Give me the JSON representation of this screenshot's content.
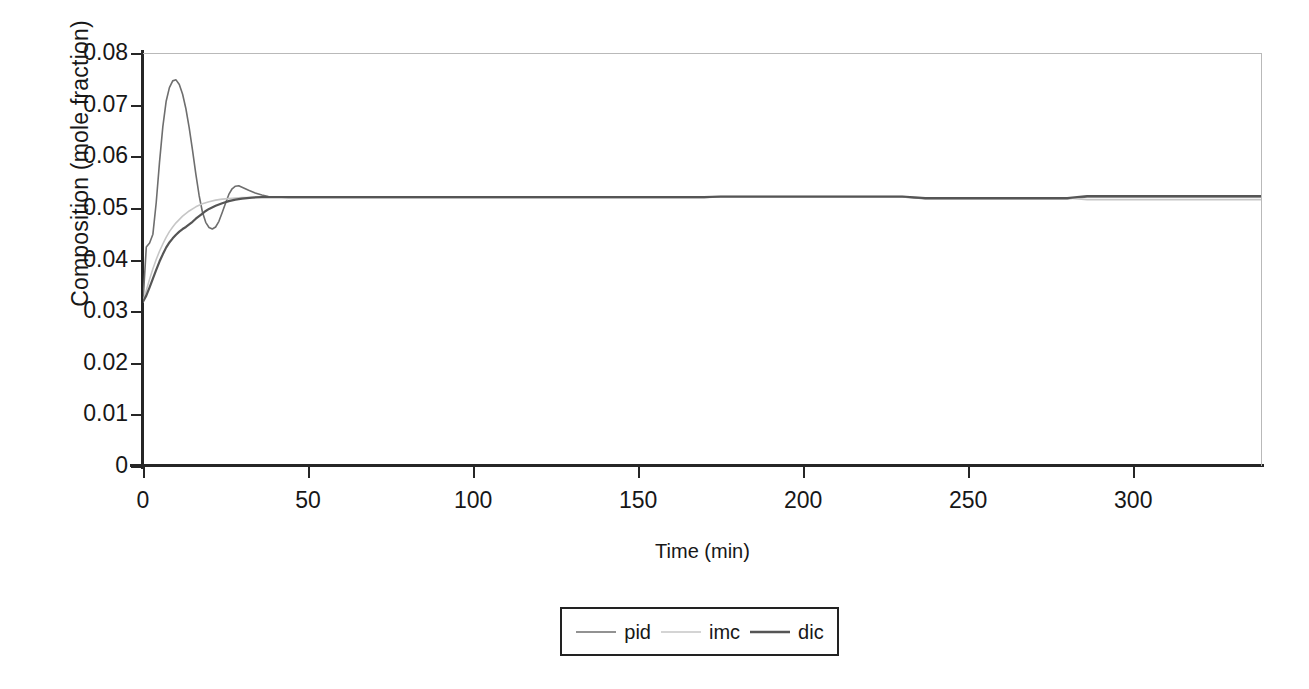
{
  "chart_data": {
    "type": "line",
    "title": "",
    "xlabel": "Time (min)",
    "ylabel": "Composition (mole fraction)",
    "xlim": [
      0,
      339
    ],
    "ylim": [
      0,
      0.08
    ],
    "xticks": [
      0,
      50,
      100,
      150,
      200,
      250,
      300
    ],
    "yticks": [
      0,
      0.01,
      0.02,
      0.03,
      0.04,
      0.05,
      0.06,
      0.07,
      0.08
    ],
    "xtick_labels": [
      "0",
      "50",
      "100",
      "150",
      "200",
      "250",
      "300"
    ],
    "ytick_labels": [
      "0",
      "0.01",
      "0.02",
      "0.03",
      "0.04",
      "0.05",
      "0.06",
      "0.07",
      "0.08"
    ],
    "grid": false,
    "legend_position": "below-center",
    "series": [
      {
        "name": "pid",
        "color": "#6e6e6e",
        "width": 1.6,
        "x": [
          0,
          1,
          2,
          3,
          4,
          5,
          6,
          7,
          8,
          9,
          10,
          11,
          12,
          13,
          14,
          15,
          16,
          17,
          18,
          19,
          20,
          21,
          22,
          23,
          24,
          25,
          26,
          27,
          28,
          29,
          30,
          32,
          34,
          36,
          38,
          40,
          44,
          50,
          60,
          80,
          120,
          170,
          175,
          200,
          230,
          237,
          260,
          280,
          286,
          300,
          320,
          339
        ],
        "y": [
          0.0318,
          0.0424,
          0.0432,
          0.0449,
          0.051,
          0.0588,
          0.0657,
          0.0706,
          0.0733,
          0.0746,
          0.0748,
          0.0739,
          0.072,
          0.0692,
          0.0655,
          0.0612,
          0.0566,
          0.0524,
          0.0492,
          0.0472,
          0.0462,
          0.0459,
          0.0463,
          0.0474,
          0.0491,
          0.0509,
          0.0526,
          0.0537,
          0.0542,
          0.0543,
          0.054,
          0.0534,
          0.0529,
          0.0525,
          0.0522,
          0.0521,
          0.052,
          0.052,
          0.052,
          0.052,
          0.052,
          0.052,
          0.0521,
          0.0521,
          0.0521,
          0.0518,
          0.0518,
          0.0518,
          0.0521,
          0.0521,
          0.0521,
          0.0521
        ]
      },
      {
        "name": "imc",
        "color": "#c6c6c6",
        "width": 1.6,
        "x": [
          0,
          1,
          2,
          3,
          4,
          5,
          6,
          7,
          8,
          9,
          10,
          12,
          14,
          16,
          18,
          20,
          22,
          24,
          26,
          28,
          30,
          33,
          36,
          40,
          44,
          50,
          60,
          80,
          120,
          170,
          175,
          200,
          230,
          237,
          260,
          280,
          286,
          300,
          320,
          339
        ],
        "y": [
          0.0318,
          0.034,
          0.0362,
          0.0382,
          0.04,
          0.0416,
          0.043,
          0.0443,
          0.0454,
          0.0463,
          0.0471,
          0.0484,
          0.0494,
          0.0502,
          0.0508,
          0.0512,
          0.0515,
          0.0517,
          0.0518,
          0.0519,
          0.052,
          0.052,
          0.0521,
          0.0521,
          0.0521,
          0.0521,
          0.0521,
          0.0521,
          0.0521,
          0.0521,
          0.0522,
          0.0522,
          0.0522,
          0.0519,
          0.0519,
          0.0519,
          0.0516,
          0.0516,
          0.0516,
          0.0516
        ]
      },
      {
        "name": "dic",
        "color": "#555555",
        "width": 2.2,
        "x": [
          0,
          1,
          2,
          3,
          4,
          5,
          6,
          7,
          8,
          9,
          10,
          11,
          12,
          13,
          14,
          15,
          16,
          17,
          18,
          19,
          20,
          22,
          24,
          26,
          28,
          30,
          33,
          36,
          40,
          44,
          50,
          60,
          80,
          120,
          170,
          175,
          200,
          230,
          237,
          260,
          280,
          286,
          300,
          320,
          339
        ],
        "y": [
          0.0318,
          0.033,
          0.0346,
          0.0363,
          0.038,
          0.0396,
          0.041,
          0.0423,
          0.0433,
          0.0441,
          0.0448,
          0.0454,
          0.0459,
          0.0463,
          0.0468,
          0.0473,
          0.0479,
          0.0484,
          0.0489,
          0.0494,
          0.0498,
          0.0504,
          0.0509,
          0.0513,
          0.0516,
          0.0518,
          0.052,
          0.0521,
          0.0521,
          0.0521,
          0.0521,
          0.0521,
          0.0521,
          0.0521,
          0.0521,
          0.0522,
          0.0522,
          0.0522,
          0.0519,
          0.0519,
          0.0519,
          0.0523,
          0.0523,
          0.0523,
          0.0523
        ]
      }
    ]
  },
  "legend": {
    "items": [
      {
        "label": "pid",
        "color": "#6e6e6e",
        "width": 1.6
      },
      {
        "label": "imc",
        "color": "#c6c6c6",
        "width": 1.6
      },
      {
        "label": "dic",
        "color": "#555555",
        "width": 2.4
      }
    ]
  },
  "style": {
    "axis_color": "#262626",
    "frame_color": "#b9b9b9",
    "text_color": "#171717",
    "background": "#ffffff"
  }
}
